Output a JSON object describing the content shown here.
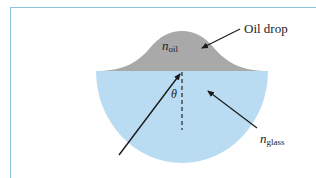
{
  "diagram": {
    "labels": {
      "oil_drop": "Oil drop",
      "n_oil_main": "n",
      "n_oil_sub": "oil",
      "n_glass_main": "n",
      "n_glass_sub": "glass",
      "theta": "θ"
    },
    "colors": {
      "oil": "#a9a9a9",
      "glass": "#b9dcf2",
      "frame": "#8cc4d8",
      "arrow": "#1a1a1a",
      "normal_line": "#333333"
    }
  }
}
